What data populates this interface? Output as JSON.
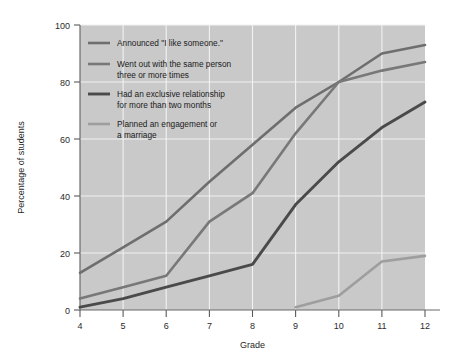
{
  "chart_data": {
    "type": "line",
    "title": "",
    "xlabel": "Grade",
    "ylabel": "Percentage of students",
    "x": [
      4,
      5,
      6,
      7,
      8,
      9,
      10,
      11,
      12
    ],
    "xticklabels": [
      "4",
      "5",
      "6",
      "7",
      "8",
      "9",
      "10",
      "11",
      "12"
    ],
    "xlim": [
      4,
      12
    ],
    "ylim": [
      0,
      100
    ],
    "yticks": [
      0,
      20,
      40,
      60,
      80,
      100
    ],
    "yticklabels": [
      "0",
      "20",
      "40",
      "60",
      "80",
      "100"
    ],
    "grid": true,
    "legend_position": "upper-left-inside",
    "series": [
      {
        "name": "Announced \"I like someone.\"",
        "color": "#6e6e6e",
        "x": [
          4,
          5,
          6,
          7,
          8,
          9,
          10,
          11,
          12
        ],
        "values": [
          13,
          22,
          31,
          45,
          58,
          71,
          80,
          90,
          93
        ]
      },
      {
        "name": "Went out with the same person three or more times",
        "color": "#787878",
        "x": [
          4,
          5,
          6,
          7,
          8,
          9,
          10,
          11,
          12
        ],
        "values": [
          4,
          8,
          12,
          31,
          41,
          62,
          80,
          84,
          87
        ]
      },
      {
        "name": "Had an exclusive relationship for more than two months",
        "color": "#4a4a4a",
        "x": [
          4,
          5,
          6,
          7,
          8,
          9,
          10,
          11,
          12
        ],
        "values": [
          1,
          4,
          8,
          12,
          16,
          37,
          52,
          64,
          73
        ]
      },
      {
        "name": "Planned an engagement or a marriage",
        "color": "#9e9e9e",
        "x": [
          4,
          5,
          6,
          7,
          8,
          9,
          10,
          11,
          12
        ],
        "values": [
          0,
          0,
          0,
          0,
          0,
          1,
          5,
          17,
          19
        ]
      }
    ]
  },
  "legend": {
    "entries": [
      {
        "label_line1": "Announced \"I like someone.\"",
        "label_line2": ""
      },
      {
        "label_line1": "Went out with the same person",
        "label_line2": "three or more times"
      },
      {
        "label_line1": "Had an exclusive relationship",
        "label_line2": "for more than two months"
      },
      {
        "label_line1": "Planned an engagement or",
        "label_line2": "a marriage"
      }
    ]
  },
  "colors": {
    "page_background": "#ffffff",
    "plot_background": "#c9c9c9",
    "gridline": "#f2f2f2",
    "axis": "#6b6b6b",
    "text": "#1f1f1f"
  }
}
